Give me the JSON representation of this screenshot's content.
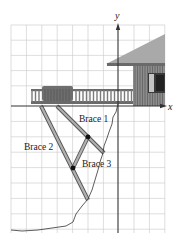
{
  "diagram": {
    "type": "coordinate-grid illustration",
    "axes": {
      "x_label": "x",
      "y_label": "y"
    },
    "labels": {
      "brace1": "Brace 1",
      "brace2": "Brace 2",
      "brace3": "Brace 3"
    },
    "colors": {
      "grid": "#c8c8c8",
      "axis": "#333333",
      "roof": "#a9a9a9",
      "wall": "#7a7a7a",
      "brace": "#9a9a9a",
      "brace_edge": "#555555",
      "bench": "#6e6e6e",
      "railing": "#8a8a8a",
      "window": "#3a3a3a",
      "window_light": "#c4c4c4",
      "cliff": "#333333",
      "dot": "#111111"
    }
  }
}
